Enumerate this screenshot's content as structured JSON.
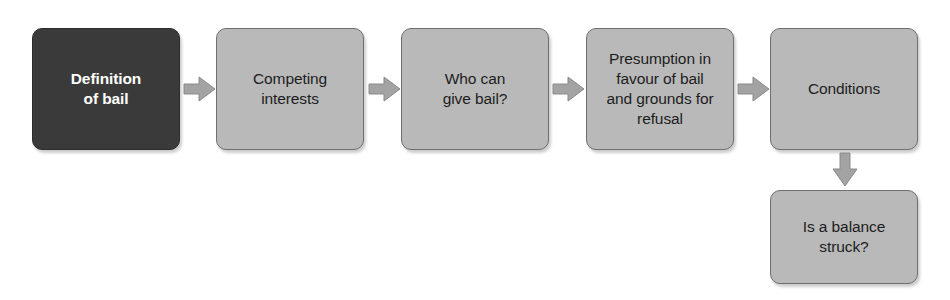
{
  "diagram": {
    "background_color": "#ffffff",
    "palette": {
      "box_light_fill": "#b9b9b9",
      "box_light_border": "#6f6f6f",
      "box_dark_fill": "#3a3a3a",
      "box_dark_text": "#ffffff",
      "box_light_text": "#1d1d1d",
      "arrow_fill": "#a0a0a0",
      "arrow_stroke": "#7a7a7a"
    },
    "nodes": [
      {
        "id": "definition-of-bail",
        "label": "Definition\nof bail",
        "style": "dark",
        "x": 32,
        "y": 28,
        "width": 148,
        "height": 122
      },
      {
        "id": "competing-interests",
        "label": "Competing\ninterests",
        "style": "light",
        "x": 216,
        "y": 28,
        "width": 148,
        "height": 122
      },
      {
        "id": "who-can-give-bail",
        "label": "Who can\ngive bail?",
        "style": "light",
        "x": 401,
        "y": 28,
        "width": 148,
        "height": 122
      },
      {
        "id": "presumption-in-favour-of-bail",
        "label": "Presumption in\nfavour of bail\nand grounds for\nrefusal",
        "style": "light",
        "x": 586,
        "y": 28,
        "width": 148,
        "height": 122
      },
      {
        "id": "conditions",
        "label": "Conditions",
        "style": "light",
        "x": 770,
        "y": 28,
        "width": 148,
        "height": 122
      },
      {
        "id": "is-a-balance-struck",
        "label": "Is a balance\nstruck?",
        "style": "light",
        "x": 770,
        "y": 190,
        "width": 148,
        "height": 94
      }
    ],
    "arrows": [
      {
        "id": "arrow-definition-to-competing",
        "from": "definition-of-bail",
        "to": "competing-interests",
        "direction": "right"
      },
      {
        "id": "arrow-competing-to-who",
        "from": "competing-interests",
        "to": "who-can-give-bail",
        "direction": "right"
      },
      {
        "id": "arrow-who-to-presumption",
        "from": "who-can-give-bail",
        "to": "presumption-in-favour-of-bail",
        "direction": "right"
      },
      {
        "id": "arrow-presumption-to-conditions",
        "from": "presumption-in-favour-of-bail",
        "to": "conditions",
        "direction": "right"
      },
      {
        "id": "arrow-conditions-to-balance",
        "from": "conditions",
        "to": "is-a-balance-struck",
        "direction": "down"
      }
    ]
  }
}
